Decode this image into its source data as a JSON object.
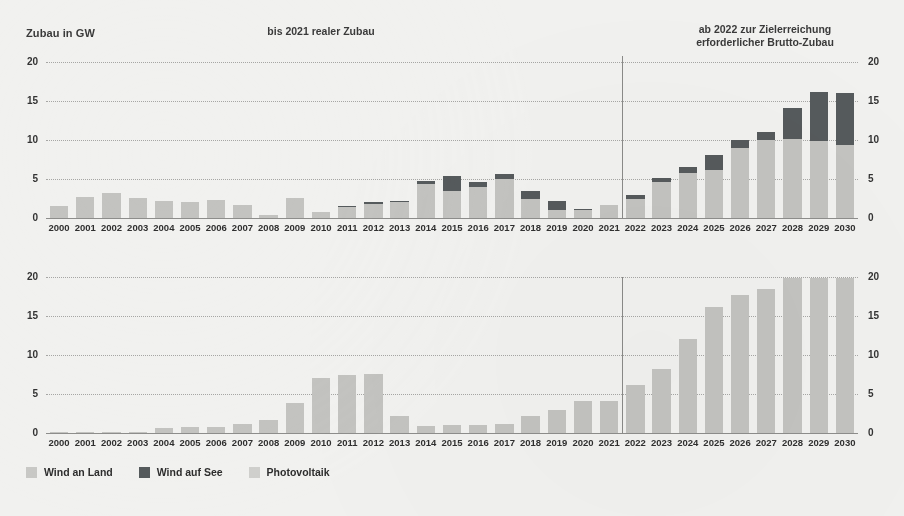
{
  "figure": {
    "y_axis_title": "Zubau in GW",
    "left_header": "bis 2021 realer Zubau",
    "right_header_line1": "ab 2022 zur Zielerreichung",
    "right_header_line2": "erforderlicher Brutto-Zubau",
    "divider_year": "2022",
    "background_color": "#f1f1ef"
  },
  "legend": {
    "position": "bottom-left",
    "items": [
      {
        "key": "land",
        "label": "Wind an Land",
        "color": "#c8c8c5"
      },
      {
        "key": "see",
        "label": "Wind auf See",
        "color": "#555a5c"
      },
      {
        "key": "pv",
        "label": "Photovoltaik",
        "color": "#cfcfcc"
      }
    ]
  },
  "chart_data": [
    {
      "id": "wind-chart",
      "type": "bar",
      "stacked": true,
      "title": "",
      "xlabel": "",
      "ylabel": "Zubau in GW",
      "ylim": [
        0,
        20
      ],
      "yticks": [
        0,
        5,
        10,
        15,
        20
      ],
      "grid": true,
      "legend": [
        "Wind an Land",
        "Wind auf See"
      ],
      "categories": [
        "2000",
        "2001",
        "2002",
        "2003",
        "2004",
        "2005",
        "2006",
        "2007",
        "2008",
        "2009",
        "2010",
        "2011",
        "2012",
        "2013",
        "2014",
        "2015",
        "2016",
        "2017",
        "2018",
        "2019",
        "2020",
        "2021",
        "2022",
        "2023",
        "2024",
        "2025",
        "2026",
        "2027",
        "2028",
        "2029",
        "2030"
      ],
      "series": [
        {
          "name": "Wind an Land",
          "color": "#c3c3c0",
          "values": [
            1.6,
            2.7,
            3.2,
            2.6,
            2.2,
            2.0,
            2.3,
            1.7,
            0.4,
            2.6,
            0.8,
            1.4,
            1.8,
            2.0,
            4.4,
            3.5,
            4.0,
            5.0,
            2.4,
            1.0,
            1.0,
            1.7,
            2.4,
            4.6,
            5.8,
            6.1,
            9.0,
            10.0,
            10.1,
            9.9,
            9.4
          ]
        },
        {
          "name": "Wind auf See",
          "color": "#555a5c",
          "values": [
            0,
            0,
            0,
            0,
            0,
            0,
            0,
            0,
            0,
            0,
            0,
            0.2,
            0.2,
            0.2,
            0.3,
            1.9,
            0.6,
            0.6,
            1.0,
            1.2,
            0.2,
            0,
            0.6,
            0.5,
            0.8,
            2.0,
            1.0,
            1.0,
            4.0,
            6.2,
            6.6
          ]
        }
      ]
    },
    {
      "id": "pv-chart",
      "type": "bar",
      "stacked": false,
      "title": "",
      "xlabel": "",
      "ylabel": "",
      "ylim": [
        0,
        20
      ],
      "yticks": [
        0,
        5,
        10,
        15,
        20
      ],
      "grid": true,
      "legend": [
        "Photovoltaik"
      ],
      "categories": [
        "2000",
        "2001",
        "2002",
        "2003",
        "2004",
        "2005",
        "2006",
        "2007",
        "2008",
        "2009",
        "2010",
        "2011",
        "2012",
        "2013",
        "2014",
        "2015",
        "2016",
        "2017",
        "2018",
        "2019",
        "2020",
        "2021",
        "2022",
        "2023",
        "2024",
        "2025",
        "2026",
        "2027",
        "2028",
        "2029",
        "2030"
      ],
      "series": [
        {
          "name": "Photovoltaik",
          "color": "#c3c3c0",
          "values": [
            0.05,
            0.1,
            0.1,
            0.15,
            0.6,
            0.8,
            0.8,
            1.2,
            1.7,
            3.9,
            7.0,
            7.5,
            7.6,
            2.2,
            0.9,
            1.0,
            1.0,
            1.2,
            2.2,
            3.0,
            4.1,
            4.1,
            6.2,
            8.2,
            12.1,
            16.1,
            17.7,
            18.5,
            19.9,
            19.9,
            19.9
          ]
        }
      ]
    }
  ]
}
